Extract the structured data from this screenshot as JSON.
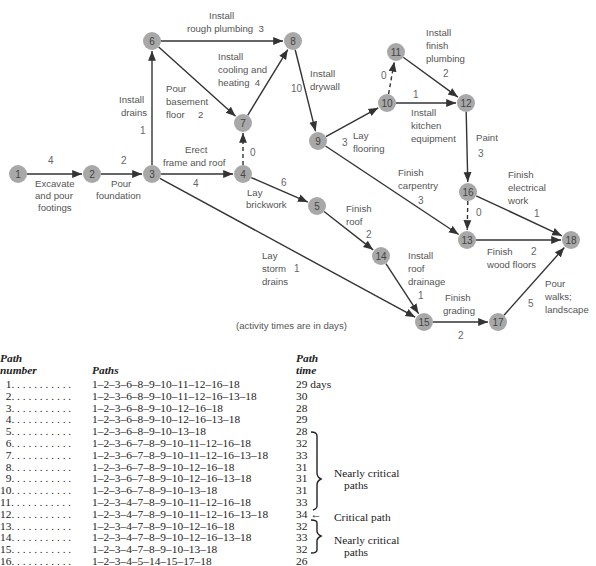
{
  "diagram": {
    "note": "(activity times are in days)",
    "nodes": [
      {
        "id": "1",
        "x": 18,
        "y": 174
      },
      {
        "id": "2",
        "x": 92,
        "y": 174
      },
      {
        "id": "3",
        "x": 152,
        "y": 174
      },
      {
        "id": "4",
        "x": 243,
        "y": 174
      },
      {
        "id": "5",
        "x": 317,
        "y": 206
      },
      {
        "id": "6",
        "x": 152,
        "y": 41
      },
      {
        "id": "7",
        "x": 243,
        "y": 123
      },
      {
        "id": "8",
        "x": 293,
        "y": 41
      },
      {
        "id": "9",
        "x": 318,
        "y": 141
      },
      {
        "id": "10",
        "x": 387,
        "y": 103
      },
      {
        "id": "11",
        "x": 396,
        "y": 52
      },
      {
        "id": "12",
        "x": 466,
        "y": 103
      },
      {
        "id": "13",
        "x": 467,
        "y": 240
      },
      {
        "id": "14",
        "x": 381,
        "y": 256
      },
      {
        "id": "15",
        "x": 424,
        "y": 322
      },
      {
        "id": "16",
        "x": 468,
        "y": 192
      },
      {
        "id": "17",
        "x": 498,
        "y": 322
      },
      {
        "id": "18",
        "x": 571,
        "y": 240
      }
    ],
    "activities": [
      {
        "from": "1",
        "to": "2",
        "label": "Excavate and pour footings",
        "time": "4",
        "dummy": false
      },
      {
        "from": "2",
        "to": "3",
        "label": "Pour foundation",
        "time": "2",
        "dummy": false
      },
      {
        "from": "3",
        "to": "6",
        "label": "Install drains",
        "time": "1",
        "dummy": false
      },
      {
        "from": "3",
        "to": "4",
        "label": "Erect frame and roof",
        "time": "4",
        "dummy": false
      },
      {
        "from": "3",
        "to": "15",
        "label": "Lay storm drains",
        "time": "1",
        "dummy": false
      },
      {
        "from": "6",
        "to": "8",
        "label": "Install rough plumbing",
        "time": "3",
        "dummy": false
      },
      {
        "from": "6",
        "to": "7",
        "label": "Pour basement floor",
        "time": "2",
        "dummy": false
      },
      {
        "from": "4",
        "to": "7",
        "label": "",
        "time": "0",
        "dummy": true
      },
      {
        "from": "7",
        "to": "8",
        "label": "Install cooling and heating",
        "time": "4",
        "dummy": false
      },
      {
        "from": "4",
        "to": "5",
        "label": "Lay brickwork",
        "time": "6",
        "dummy": false
      },
      {
        "from": "8",
        "to": "9",
        "label": "Install drywall",
        "time": "10",
        "dummy": false
      },
      {
        "from": "9",
        "to": "10",
        "label": "Lay flooring",
        "time": "3",
        "dummy": false
      },
      {
        "from": "10",
        "to": "11",
        "label": "",
        "time": "0",
        "dummy": true
      },
      {
        "from": "10",
        "to": "12",
        "label": "Install kitchen equipment",
        "time": "1",
        "dummy": false
      },
      {
        "from": "11",
        "to": "12",
        "label": "Install finish plumbing",
        "time": "2",
        "dummy": false
      },
      {
        "from": "9",
        "to": "13",
        "label": "Finish carpentry",
        "time": "3",
        "dummy": false
      },
      {
        "from": "12",
        "to": "16",
        "label": "Paint",
        "time": "3",
        "dummy": false
      },
      {
        "from": "16",
        "to": "13",
        "label": "",
        "time": "0",
        "dummy": true
      },
      {
        "from": "16",
        "to": "18",
        "label": "Finish electrical work",
        "time": "1",
        "dummy": false
      },
      {
        "from": "13",
        "to": "18",
        "label": "Finish wood floors",
        "time": "2",
        "dummy": false
      },
      {
        "from": "5",
        "to": "14",
        "label": "Finish roof",
        "time": "2",
        "dummy": false
      },
      {
        "from": "14",
        "to": "15",
        "label": "Install roof drainage",
        "time": "1",
        "dummy": false
      },
      {
        "from": "15",
        "to": "17",
        "label": "Finish grading",
        "time": "2",
        "dummy": false
      },
      {
        "from": "17",
        "to": "18",
        "label": "Pour walks; landscape",
        "time": "5",
        "dummy": false
      }
    ],
    "text_labels": [
      {
        "text": "4",
        "x": 48,
        "y": 164,
        "cls": "num"
      },
      {
        "text": "Excavate",
        "x": 35,
        "y": 187,
        "cls": "lbl"
      },
      {
        "text": "and pour",
        "x": 35,
        "y": 199,
        "cls": "lbl"
      },
      {
        "text": "footings",
        "x": 38,
        "y": 211,
        "cls": "lbl"
      },
      {
        "text": "2",
        "x": 121,
        "y": 164,
        "cls": "num"
      },
      {
        "text": "Pour",
        "x": 111,
        "y": 187,
        "cls": "lbl"
      },
      {
        "text": "foundation",
        "x": 96,
        "y": 199,
        "cls": "lbl"
      },
      {
        "text": "Install",
        "x": 119,
        "y": 103,
        "cls": "lbl"
      },
      {
        "text": "drains",
        "x": 121,
        "y": 116,
        "cls": "lbl"
      },
      {
        "text": "1",
        "x": 140,
        "y": 134,
        "cls": "num"
      },
      {
        "text": "Install",
        "x": 209,
        "y": 19,
        "cls": "lbl"
      },
      {
        "text": "rough plumbing  3",
        "x": 187,
        "y": 32,
        "cls": "lbl"
      },
      {
        "text": "Install",
        "x": 218,
        "y": 60,
        "cls": "lbl"
      },
      {
        "text": "cooling and",
        "x": 218,
        "y": 73,
        "cls": "lbl"
      },
      {
        "text": "heating  4",
        "x": 218,
        "y": 86,
        "cls": "lbl"
      },
      {
        "text": "Pour",
        "x": 166,
        "y": 92,
        "cls": "lbl"
      },
      {
        "text": "basement",
        "x": 166,
        "y": 105,
        "cls": "lbl"
      },
      {
        "text": "floor     2",
        "x": 166,
        "y": 118,
        "cls": "lbl"
      },
      {
        "text": "0",
        "x": 250,
        "y": 156,
        "cls": "num"
      },
      {
        "text": "Erect",
        "x": 185,
        "y": 153,
        "cls": "lbl"
      },
      {
        "text": "frame and roof",
        "x": 163,
        "y": 166,
        "cls": "lbl"
      },
      {
        "text": "4",
        "x": 193,
        "y": 187,
        "cls": "num"
      },
      {
        "text": "6",
        "x": 281,
        "y": 186,
        "cls": "num"
      },
      {
        "text": "Lay",
        "x": 247,
        "y": 196,
        "cls": "lbl"
      },
      {
        "text": "brickwork",
        "x": 246,
        "y": 208,
        "cls": "lbl"
      },
      {
        "text": "10",
        "x": 291,
        "y": 92,
        "cls": "num"
      },
      {
        "text": "Install",
        "x": 310,
        "y": 77,
        "cls": "lbl"
      },
      {
        "text": "drywall",
        "x": 310,
        "y": 90,
        "cls": "lbl"
      },
      {
        "text": "3",
        "x": 342,
        "y": 146,
        "cls": "num"
      },
      {
        "text": "Lay",
        "x": 353,
        "y": 139,
        "cls": "lbl"
      },
      {
        "text": "flooring",
        "x": 353,
        "y": 152,
        "cls": "lbl"
      },
      {
        "text": "0",
        "x": 381,
        "y": 79,
        "cls": "num"
      },
      {
        "text": "1",
        "x": 413,
        "y": 98,
        "cls": "num"
      },
      {
        "text": "Install",
        "x": 411,
        "y": 116,
        "cls": "lbl"
      },
      {
        "text": "kitchen",
        "x": 411,
        "y": 129,
        "cls": "lbl"
      },
      {
        "text": "equipment",
        "x": 411,
        "y": 142,
        "cls": "lbl"
      },
      {
        "text": "Install",
        "x": 426,
        "y": 36,
        "cls": "lbl"
      },
      {
        "text": "finish",
        "x": 426,
        "y": 49,
        "cls": "lbl"
      },
      {
        "text": "plumbing",
        "x": 426,
        "y": 62,
        "cls": "lbl"
      },
      {
        "text": "2",
        "x": 443,
        "y": 77,
        "cls": "num"
      },
      {
        "text": "Paint",
        "x": 476,
        "y": 141,
        "cls": "lbl"
      },
      {
        "text": "3",
        "x": 478,
        "y": 157,
        "cls": "num"
      },
      {
        "text": "Finish",
        "x": 398,
        "y": 176,
        "cls": "lbl"
      },
      {
        "text": "carpentry",
        "x": 398,
        "y": 189,
        "cls": "lbl"
      },
      {
        "text": "3",
        "x": 418,
        "y": 204,
        "cls": "num"
      },
      {
        "text": "Finish",
        "x": 508,
        "y": 178,
        "cls": "lbl"
      },
      {
        "text": "electrical",
        "x": 508,
        "y": 191,
        "cls": "lbl"
      },
      {
        "text": "work",
        "x": 508,
        "y": 204,
        "cls": "lbl"
      },
      {
        "text": "0",
        "x": 476,
        "y": 216,
        "cls": "num"
      },
      {
        "text": "1",
        "x": 534,
        "y": 217,
        "cls": "num"
      },
      {
        "text": "Finish",
        "x": 487,
        "y": 255,
        "cls": "lbl"
      },
      {
        "text": "2",
        "x": 531,
        "y": 255,
        "cls": "num"
      },
      {
        "text": "wood floors",
        "x": 487,
        "y": 268,
        "cls": "lbl"
      },
      {
        "text": "Finish",
        "x": 346,
        "y": 212,
        "cls": "lbl"
      },
      {
        "text": "roof",
        "x": 346,
        "y": 225,
        "cls": "lbl"
      },
      {
        "text": "2",
        "x": 366,
        "y": 238,
        "cls": "num"
      },
      {
        "text": "Lay",
        "x": 262,
        "y": 259,
        "cls": "lbl"
      },
      {
        "text": "storm",
        "x": 262,
        "y": 272,
        "cls": "lbl"
      },
      {
        "text": "1",
        "x": 294,
        "y": 272,
        "cls": "num"
      },
      {
        "text": "drains",
        "x": 262,
        "y": 285,
        "cls": "lbl"
      },
      {
        "text": "Install",
        "x": 408,
        "y": 259,
        "cls": "lbl"
      },
      {
        "text": "roof",
        "x": 408,
        "y": 272,
        "cls": "lbl"
      },
      {
        "text": "drainage",
        "x": 408,
        "y": 285,
        "cls": "lbl"
      },
      {
        "text": "1",
        "x": 418,
        "y": 299,
        "cls": "num"
      },
      {
        "text": "Finish",
        "x": 445,
        "y": 301,
        "cls": "lbl"
      },
      {
        "text": "grading",
        "x": 443,
        "y": 314,
        "cls": "lbl"
      },
      {
        "text": "2",
        "x": 458,
        "y": 339,
        "cls": "num"
      },
      {
        "text": "5",
        "x": 528,
        "y": 307,
        "cls": "num"
      },
      {
        "text": "Pour",
        "x": 545,
        "y": 287,
        "cls": "lbl"
      },
      {
        "text": "walks;",
        "x": 545,
        "y": 300,
        "cls": "lbl"
      },
      {
        "text": "landscape",
        "x": 545,
        "y": 313,
        "cls": "lbl"
      }
    ],
    "colors": {
      "node_fill": "#a8a8a8",
      "edge": "#333333",
      "text": "#555555"
    }
  },
  "table": {
    "headers": {
      "number_line1": "Path",
      "number_line2": "number",
      "paths": "Paths",
      "time_line1": "Path",
      "time_line2": "time"
    },
    "rows": [
      {
        "number": "1",
        "path": "1–2–3–6–8–9–10–11–12–16–18",
        "time": "29 days"
      },
      {
        "number": "2",
        "path": "1–2–3–6–8–9–10–11–12–16–13–18",
        "time": "30"
      },
      {
        "number": "3",
        "path": "1–2–3–6–8–9–10–12–16–18",
        "time": "28"
      },
      {
        "number": "4",
        "path": "1–2–3–6–8–9–10–12–16–13–18",
        "time": "29"
      },
      {
        "number": "5",
        "path": "1–2–3–6–8–9–10–13–18",
        "time": "28"
      },
      {
        "number": "6",
        "path": "1–2–3–6–7–8–9–10–11–12–16–18",
        "time": "32"
      },
      {
        "number": "7",
        "path": "1–2–3–6–7–8–9–10–11–12–16–13–18",
        "time": "33"
      },
      {
        "number": "8",
        "path": "1–2–3–6–7–8–9–10–12–16–18",
        "time": "31"
      },
      {
        "number": "9",
        "path": "1–2–3–6–7–8–9–10–12–16–13–18",
        "time": "31"
      },
      {
        "number": "10",
        "path": "1–2–3–6–7–8–9–10–13–18",
        "time": "31"
      },
      {
        "number": "11",
        "path": "1–2–3–4–7–8–9–10–11–12–16–18",
        "time": "33"
      },
      {
        "number": "12",
        "path": "1–2–3–4–7–8–9–10–11–12–16–13–18",
        "time": "34 ←"
      },
      {
        "number": "13",
        "path": "1–2–3–4–7–8–9–10–12–16–18",
        "time": "32"
      },
      {
        "number": "14",
        "path": "1–2–3–4–7–8–9–10–12–16–13–18",
        "time": "33"
      },
      {
        "number": "15",
        "path": "1–2–3–4–7–8–9–10–13–18",
        "time": "32"
      },
      {
        "number": "16",
        "path": "1–2–3–4–5–14–15–17–18",
        "time": "26"
      }
    ],
    "annotations": {
      "nearly_critical_1_line1": "Nearly critical",
      "nearly_critical_1_line2": "paths",
      "critical": "Critical path",
      "nearly_critical_2_line1": "Nearly critical",
      "nearly_critical_2_line2": "paths"
    }
  }
}
